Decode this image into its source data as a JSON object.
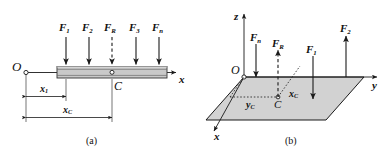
{
  "figure": {
    "caption_a": "(a)",
    "caption_b": "(b)",
    "colors": {
      "stroke": "#1a1a1a",
      "bar_fill": "#c9c9c9",
      "bar_edge": "#4a4a4a",
      "plane_fill": "#d0d0d0",
      "plane_edge": "#2a2a2a",
      "background": "#ffffff"
    }
  },
  "panel_a": {
    "name": "parallel-force-system-on-bar",
    "origin_label": "O",
    "centroid_label": "C",
    "axis_x_label": "x",
    "forces": [
      {
        "label": "F",
        "sub": "1",
        "direction": "down",
        "style": "solid"
      },
      {
        "label": "F",
        "sub": "2",
        "direction": "down",
        "style": "solid"
      },
      {
        "label": "F",
        "sub": "R",
        "direction": "down",
        "style": "dashed"
      },
      {
        "label": "F",
        "sub": "3",
        "direction": "down",
        "style": "solid"
      },
      {
        "label": "F",
        "sub": "n",
        "direction": "down",
        "style": "solid"
      }
    ],
    "dimensions": [
      {
        "label": "x",
        "sub": "1",
        "name": "dimension-x1"
      },
      {
        "label": "x",
        "sub": "C",
        "name": "dimension-xc"
      }
    ]
  },
  "panel_b": {
    "name": "parallel-force-system-on-plane",
    "origin_label": "O",
    "centroid_label": "C",
    "axis_x_label": "x",
    "axis_y_label": "y",
    "axis_z_label": "z",
    "forces": [
      {
        "label": "F",
        "sub": "n",
        "direction": "down",
        "style": "solid"
      },
      {
        "label": "F",
        "sub": "R",
        "direction": "up",
        "style": "dashed"
      },
      {
        "label": "F",
        "sub": "1",
        "direction": "down",
        "style": "solid"
      },
      {
        "label": "F",
        "sub": "2",
        "direction": "up",
        "style": "solid"
      }
    ],
    "coordinates": [
      {
        "label": "y",
        "sub": "C",
        "name": "coordinate-yc"
      },
      {
        "label": "x",
        "sub": "C",
        "name": "coordinate-xc"
      }
    ]
  }
}
